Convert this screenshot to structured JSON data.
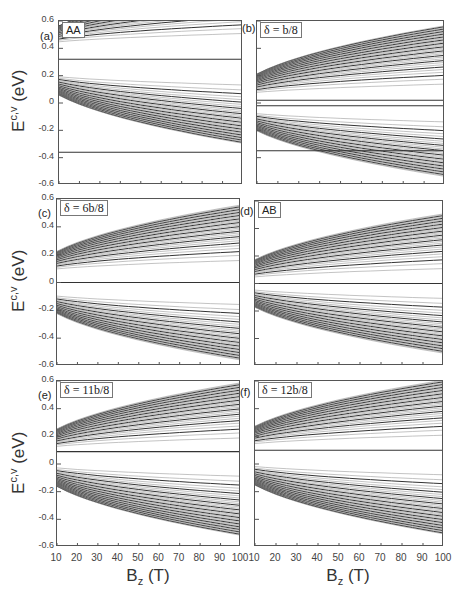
{
  "figure": {
    "y_axis_label_main": "E",
    "y_axis_label_sup": "c,v",
    "y_axis_label_unit": " (eV)",
    "x_axis_label_main": "B",
    "x_axis_label_sub": "z",
    "x_axis_label_unit": " (T)"
  },
  "panels": [
    {
      "id": "a",
      "label": "(a)",
      "tag": "AA",
      "tag_serif": false
    },
    {
      "id": "b",
      "label": "(b)",
      "tag": "δ = b/8",
      "tag_serif": true
    },
    {
      "id": "c",
      "label": "(c)",
      "tag": "δ = 6b/8",
      "tag_serif": true
    },
    {
      "id": "d",
      "label": "(d)",
      "tag": "AB",
      "tag_serif": false
    },
    {
      "id": "e",
      "label": "(e)",
      "tag": "δ = 11b/8",
      "tag_serif": true
    },
    {
      "id": "f",
      "label": "(f)",
      "tag": "δ = 12b/8",
      "tag_serif": true
    }
  ],
  "axes": {
    "y_ticks": [
      "0.6",
      "0.4",
      "0.2",
      "0",
      "-0.2",
      "-0.4",
      "-0.6"
    ],
    "x_ticks": [
      "10",
      "20",
      "30",
      "40",
      "50",
      "60",
      "70",
      "80",
      "90",
      "100"
    ]
  },
  "chart_data": {
    "type": "line",
    "title": "",
    "xlabel": "B_z (T)",
    "ylabel": "E^{c,v} (eV)",
    "xlim": [
      10,
      100
    ],
    "ylim": [
      -0.6,
      0.6
    ],
    "grid": false,
    "legend": "none",
    "subplots": [
      {
        "id": "a",
        "annotation": "AA",
        "description": "Landau-level fan; flat level at ~0.32 eV, dense valence levels fanning downward from ~0.2 eV, conduction levels fanning upward from ~0.4 eV",
        "flat_levels": [
          0.32,
          -0.36
        ],
        "fan_centers": [
          {
            "E0": 0.22,
            "direction": "down",
            "count": 40
          },
          {
            "E0": 0.42,
            "direction": "up",
            "count": 30
          }
        ]
      },
      {
        "id": "b",
        "annotation": "δ = b/8",
        "description": "Gap near 0 eV (~-0.02 to 0.02); flat level at ~-0.35 eV; levels fan up from ~0.05 and down from ~-0.05",
        "flat_levels": [
          0.02,
          -0.02,
          -0.35
        ],
        "fan_centers": [
          {
            "E0": 0.05,
            "direction": "up",
            "count": 40
          },
          {
            "E0": -0.05,
            "direction": "down",
            "count": 35
          }
        ]
      },
      {
        "id": "c",
        "annotation": "δ = 6b/8",
        "description": "Near-zero levels crossing at 0 eV; conduction fan from ~0.07 eV upward, valence fan from ~-0.07 eV downward; heavy bands near ±0.35",
        "flat_levels": [
          0.0
        ],
        "fan_centers": [
          {
            "E0": 0.07,
            "direction": "up",
            "count": 35
          },
          {
            "E0": -0.07,
            "direction": "down",
            "count": 35
          }
        ]
      },
      {
        "id": "d",
        "annotation": "AB",
        "description": "Zero-energy level at 0 eV; symmetric conduction/valence fans; heavy levels near ±0.35",
        "flat_levels": [
          0.0
        ],
        "fan_centers": [
          {
            "E0": 0.02,
            "direction": "up",
            "count": 35
          },
          {
            "E0": -0.02,
            "direction": "down",
            "count": 35
          }
        ]
      },
      {
        "id": "e",
        "annotation": "δ = 11b/8",
        "description": "Flat level at ~0.09 eV; valence fan from 0 eV downward; conduction fan from ~0.1 eV upward",
        "flat_levels": [
          0.09
        ],
        "fan_centers": [
          {
            "E0": 0.1,
            "direction": "up",
            "count": 35
          },
          {
            "E0": 0.0,
            "direction": "down",
            "count": 40
          }
        ]
      },
      {
        "id": "f",
        "annotation": "δ = 12b/8",
        "description": "Flat level at ~0.1 eV; valence fan from ~0.01 eV downward; conduction fan upward",
        "flat_levels": [
          0.1
        ],
        "fan_centers": [
          {
            "E0": 0.12,
            "direction": "up",
            "count": 35
          },
          {
            "E0": 0.01,
            "direction": "down",
            "count": 40
          }
        ]
      }
    ]
  }
}
